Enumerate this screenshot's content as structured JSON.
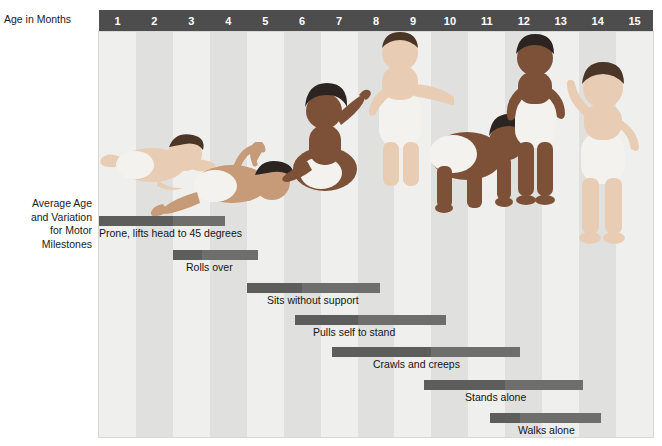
{
  "axis": {
    "age_label": "Age in Months",
    "milestones_label_lines": [
      "Average Age",
      "and Variation",
      "for Motor",
      "Milestones"
    ],
    "months": [
      "1",
      "2",
      "3",
      "4",
      "5",
      "6",
      "7",
      "8",
      "9",
      "10",
      "11",
      "12",
      "13",
      "14",
      "15"
    ]
  },
  "colors": {
    "header_bar": "#4d4d4d",
    "bar": "#6e6f6d",
    "bar_early": "#5d5e5c",
    "stripe_light": "#efefee",
    "stripe_dark": "#e0e1df",
    "text": "#141414"
  },
  "chart_data": {
    "type": "bar",
    "title": "Average Age and Variation for Motor Milestones",
    "xlabel": "Age in Months",
    "ylabel": "",
    "xlim": [
      0,
      15
    ],
    "grid": false,
    "legend": "none",
    "orientation": "horizontal-range",
    "tick_labels": [
      "1",
      "2",
      "3",
      "4",
      "5",
      "6",
      "7",
      "8",
      "9",
      "10",
      "11",
      "12",
      "13",
      "14",
      "15"
    ],
    "categories": [
      "Prone, lifts head to 45 degrees",
      "Rolls over",
      "Sits without support",
      "Pulls self to stand",
      "Crawls and creeps",
      "Stands alone",
      "Walks alone"
    ],
    "series": [
      {
        "name": "Age range (months)",
        "ranges": [
          {
            "label": "Prone, lifts head to 45 degrees",
            "start": 0.0,
            "end": 3.4,
            "average": 2.0
          },
          {
            "label": "Rolls over",
            "start": 2.0,
            "end": 4.3,
            "average": 2.8
          },
          {
            "label": "Sits without support",
            "start": 4.0,
            "end": 7.6,
            "average": 5.5
          },
          {
            "label": "Pulls self to stand",
            "start": 5.3,
            "end": 9.4,
            "average": 7.0
          },
          {
            "label": "Crawls and creeps",
            "start": 6.3,
            "end": 11.4,
            "average": 9.0
          },
          {
            "label": "Stands alone",
            "start": 8.8,
            "end": 13.1,
            "average": 11.0
          },
          {
            "label": "Walks alone",
            "start": 10.6,
            "end": 13.6,
            "average": 11.4
          }
        ]
      }
    ]
  },
  "milestones": [
    {
      "id": "prone-lifts-head",
      "label": "Prone, lifts head to 45 degrees",
      "start_month": 0.0,
      "end_month": 3.4,
      "average_month": 2.0,
      "bar_top": 206,
      "label_top": 217,
      "label_left": 0
    },
    {
      "id": "rolls-over",
      "label": "Rolls over",
      "start_month": 2.0,
      "end_month": 4.3,
      "average_month": 2.8,
      "bar_top": 240,
      "label_top": 251,
      "label_left": 87
    },
    {
      "id": "sits-without-support",
      "label": "Sits without support",
      "start_month": 4.0,
      "end_month": 7.6,
      "average_month": 5.5,
      "bar_top": 273,
      "label_top": 284,
      "label_left": 168
    },
    {
      "id": "pulls-self-to-stand",
      "label": "Pulls self to stand",
      "start_month": 5.3,
      "end_month": 9.4,
      "average_month": 7.0,
      "bar_top": 305,
      "label_top": 316,
      "label_left": 214
    },
    {
      "id": "crawls-and-creeps",
      "label": "Crawls and creeps",
      "start_month": 6.3,
      "end_month": 11.4,
      "average_month": 9.0,
      "bar_top": 337,
      "label_top": 348,
      "label_left": 274
    },
    {
      "id": "stands-alone",
      "label": "Stands alone",
      "start_month": 8.8,
      "end_month": 13.1,
      "average_month": 11.0,
      "bar_top": 370,
      "label_top": 381,
      "label_left": 366
    },
    {
      "id": "walks-alone",
      "label": "Walks alone",
      "start_month": 10.6,
      "end_month": 13.6,
      "average_month": 11.4,
      "bar_top": 403,
      "label_top": 414,
      "label_left": 419
    }
  ]
}
